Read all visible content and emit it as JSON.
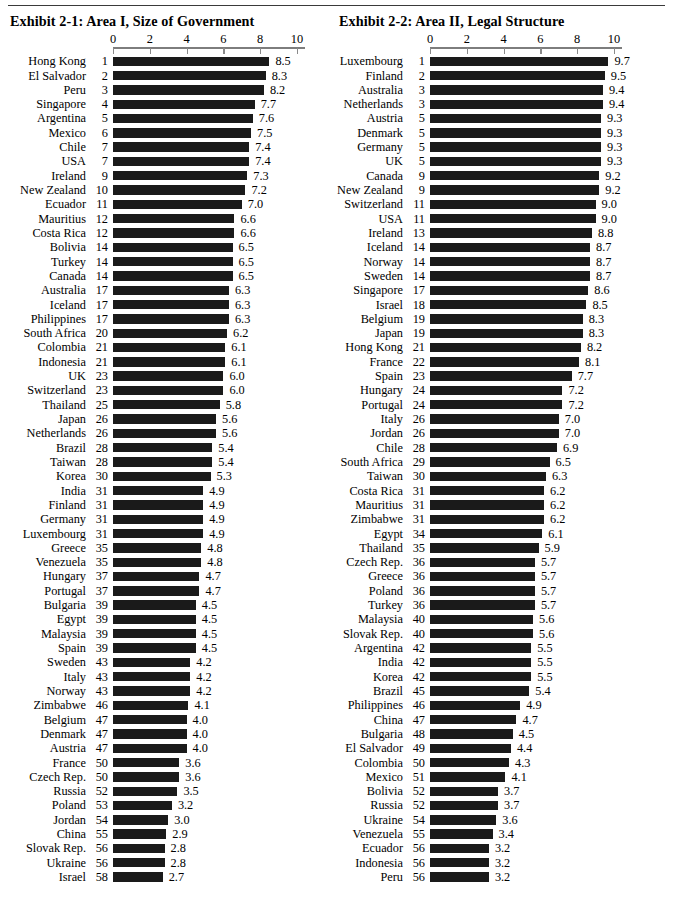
{
  "page": {
    "divider": "horizontal-rule"
  },
  "axis": {
    "ticks": [
      0,
      2,
      4,
      6,
      8,
      10
    ],
    "min": 0,
    "max": 10
  },
  "chart_data": [
    {
      "type": "bar",
      "orientation": "horizontal",
      "title": "Exhibit 2-1:  Area I, Size of Government",
      "exhibit_label": "Exhibit 2-1:",
      "exhibit_name": "Area I, Size of Government",
      "xlabel": "",
      "ylabel": "",
      "xlim": [
        0,
        10
      ],
      "xticks": [
        0,
        2,
        4,
        6,
        8,
        10
      ],
      "grid": false,
      "legend": "none",
      "categories": [
        "Hong Kong",
        "El Salvador",
        "Peru",
        "Singapore",
        "Argentina",
        "Mexico",
        "Chile",
        "USA",
        "Ireland",
        "New Zealand",
        "Ecuador",
        "Mauritius",
        "Costa Rica",
        "Bolivia",
        "Turkey",
        "Canada",
        "Australia",
        "Iceland",
        "Philippines",
        "South Africa",
        "Colombia",
        "Indonesia",
        "UK",
        "Switzerland",
        "Thailand",
        "Japan",
        "Netherlands",
        "Brazil",
        "Taiwan",
        "Korea",
        "India",
        "Finland",
        "Germany",
        "Luxembourg",
        "Greece",
        "Venezuela",
        "Hungary",
        "Portugal",
        "Bulgaria",
        "Egypt",
        "Malaysia",
        "Spain",
        "Sweden",
        "Italy",
        "Norway",
        "Zimbabwe",
        "Belgium",
        "Denmark",
        "Austria",
        "France",
        "Czech Rep.",
        "Russia",
        "Poland",
        "Jordan",
        "China",
        "Slovak Rep.",
        "Ukraine",
        "Israel"
      ],
      "ranks": [
        1,
        2,
        3,
        4,
        5,
        6,
        7,
        7,
        9,
        10,
        11,
        12,
        12,
        14,
        14,
        14,
        17,
        17,
        17,
        20,
        21,
        21,
        23,
        23,
        25,
        26,
        26,
        28,
        28,
        30,
        31,
        31,
        31,
        31,
        35,
        35,
        37,
        37,
        39,
        39,
        39,
        39,
        43,
        43,
        43,
        46,
        47,
        47,
        47,
        50,
        50,
        52,
        53,
        54,
        55,
        56,
        56,
        58
      ],
      "values": [
        8.5,
        8.3,
        8.2,
        7.7,
        7.6,
        7.5,
        7.4,
        7.4,
        7.3,
        7.2,
        7.0,
        6.6,
        6.6,
        6.5,
        6.5,
        6.5,
        6.3,
        6.3,
        6.3,
        6.2,
        6.1,
        6.1,
        6.0,
        6.0,
        5.8,
        5.6,
        5.6,
        5.4,
        5.4,
        5.3,
        4.9,
        4.9,
        4.9,
        4.9,
        4.8,
        4.8,
        4.7,
        4.7,
        4.5,
        4.5,
        4.5,
        4.5,
        4.2,
        4.2,
        4.2,
        4.1,
        4.0,
        4.0,
        4.0,
        3.6,
        3.6,
        3.5,
        3.2,
        3.0,
        2.9,
        2.8,
        2.8,
        2.7
      ],
      "value_labels": [
        "8.5",
        "8.3",
        "8.2",
        "7.7",
        "7.6",
        "7.5",
        "7.4",
        "7.4",
        "7.3",
        "7.2",
        "7.0",
        "6.6",
        "6.6",
        "6.5",
        "6.5",
        "6.5",
        "6.3",
        "6.3",
        "6.3",
        "6.2",
        "6.1",
        "6.1",
        "6.0",
        "6.0",
        "5.8",
        "5.6",
        "5.6",
        "5.4",
        "5.4",
        "5.3",
        "4.9",
        "4.9",
        "4.9",
        "4.9",
        "4.8",
        "4.8",
        "4.7",
        "4.7",
        "4.5",
        "4.5",
        "4.5",
        "4.5",
        "4.2",
        "4.2",
        "4.2",
        "4.1",
        "4.0",
        "4.0",
        "4.0",
        "3.6",
        "3.6",
        "3.5",
        "3.2",
        "3.0",
        "2.9",
        "2.8",
        "2.8",
        "2.7"
      ],
      "bar_color": "#1a1a1a"
    },
    {
      "type": "bar",
      "orientation": "horizontal",
      "title": "Exhibit 2-2:  Area II, Legal Structure",
      "exhibit_label": "Exhibit 2-2:",
      "exhibit_name": "Area II, Legal Structure",
      "xlabel": "",
      "ylabel": "",
      "xlim": [
        0,
        10
      ],
      "xticks": [
        0,
        2,
        4,
        6,
        8,
        10
      ],
      "grid": false,
      "legend": "none",
      "categories": [
        "Luxembourg",
        "Finland",
        "Australia",
        "Netherlands",
        "Austria",
        "Denmark",
        "Germany",
        "UK",
        "Canada",
        "New Zealand",
        "Switzerland",
        "USA",
        "Ireland",
        "Iceland",
        "Norway",
        "Sweden",
        "Singapore",
        "Israel",
        "Belgium",
        "Japan",
        "Hong Kong",
        "France",
        "Spain",
        "Hungary",
        "Portugal",
        "Italy",
        "Jordan",
        "Chile",
        "South Africa",
        "Taiwan",
        "Costa Rica",
        "Mauritius",
        "Zimbabwe",
        "Egypt",
        "Thailand",
        "Czech Rep.",
        "Greece",
        "Poland",
        "Turkey",
        "Malaysia",
        "Slovak Rep.",
        "Argentina",
        "India",
        "Korea",
        "Brazil",
        "Philippines",
        "China",
        "Bulgaria",
        "El Salvador",
        "Colombia",
        "Mexico",
        "Bolivia",
        "Russia",
        "Ukraine",
        "Venezuela",
        "Ecuador",
        "Indonesia",
        "Peru"
      ],
      "ranks": [
        1,
        2,
        3,
        3,
        5,
        5,
        5,
        5,
        9,
        9,
        11,
        11,
        13,
        14,
        14,
        14,
        17,
        18,
        19,
        19,
        21,
        22,
        23,
        24,
        24,
        26,
        26,
        28,
        29,
        30,
        31,
        31,
        31,
        34,
        35,
        36,
        36,
        36,
        36,
        40,
        40,
        42,
        42,
        42,
        45,
        46,
        47,
        48,
        49,
        50,
        51,
        52,
        52,
        54,
        55,
        56,
        56,
        56
      ],
      "values": [
        9.7,
        9.5,
        9.4,
        9.4,
        9.3,
        9.3,
        9.3,
        9.3,
        9.2,
        9.2,
        9.0,
        9.0,
        8.8,
        8.7,
        8.7,
        8.7,
        8.6,
        8.5,
        8.3,
        8.3,
        8.2,
        8.1,
        7.7,
        7.2,
        7.2,
        7.0,
        7.0,
        6.9,
        6.5,
        6.3,
        6.2,
        6.2,
        6.2,
        6.1,
        5.9,
        5.7,
        5.7,
        5.7,
        5.7,
        5.6,
        5.6,
        5.5,
        5.5,
        5.5,
        5.4,
        4.9,
        4.7,
        4.5,
        4.4,
        4.3,
        4.1,
        3.7,
        3.7,
        3.6,
        3.4,
        3.2,
        3.2,
        3.2
      ],
      "value_labels": [
        "9.7",
        "9.5",
        "9.4",
        "9.4",
        "9.3",
        "9.3",
        "9.3",
        "9.3",
        "9.2",
        "9.2",
        "9.0",
        "9.0",
        "8.8",
        "8.7",
        "8.7",
        "8.7",
        "8.6",
        "8.5",
        "8.3",
        "8.3",
        "8.2",
        "8.1",
        "7.7",
        "7.2",
        "7.2",
        "7.0",
        "7.0",
        "6.9",
        "6.5",
        "6.3",
        "6.2",
        "6.2",
        "6.2",
        "6.1",
        "5.9",
        "5.7",
        "5.7",
        "5.7",
        "5.7",
        "5.6",
        "5.6",
        "5.5",
        "5.5",
        "5.5",
        "5.4",
        "4.9",
        "4.7",
        "4.5",
        "4.4",
        "4.3",
        "4.1",
        "3.7",
        "3.7",
        "3.6",
        "3.4",
        "3.2",
        "3.2",
        "3.2"
      ],
      "bar_color": "#1a1a1a"
    }
  ]
}
